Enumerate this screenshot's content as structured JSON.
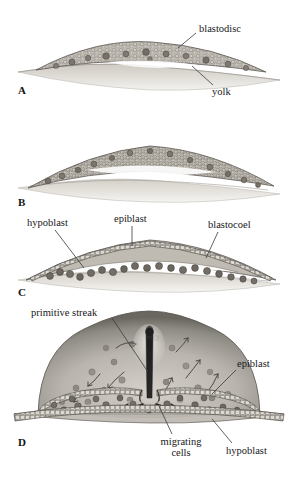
{
  "figure": {
    "background_color": "#ffffff",
    "panels": [
      {
        "letter": "A",
        "stage": "blastodisc on yolk",
        "labels": [
          "blastodisc",
          "yolk"
        ]
      },
      {
        "letter": "B",
        "stage": "cell layer separation",
        "labels": []
      },
      {
        "letter": "C",
        "stage": "epiblast and hypoblast with blastocoel",
        "labels": [
          "hypoblast",
          "epiblast",
          "blastocoel"
        ]
      },
      {
        "letter": "D",
        "stage": "primitive streak gastrulation",
        "labels": [
          "primitive streak",
          "epiblast",
          "migrating cells",
          "hypoblast"
        ]
      }
    ]
  },
  "panel_letters": {
    "a": "A",
    "b": "B",
    "c": "C",
    "d": "D"
  },
  "labels": {
    "blastodisc": "blastodisc",
    "yolk": "yolk",
    "hypoblast_c": "hypoblast",
    "epiblast_c": "epiblast",
    "blastocoel": "blastocoel",
    "primitive_streak": "primitive streak",
    "epiblast_d": "epiblast",
    "migrating_cells": "migrating cells",
    "hypoblast_d": "hypoblast"
  },
  "colors": {
    "ink": "#18181a",
    "leader_line": "#3a3a3c",
    "cell_fill": "#b9b5ad",
    "cell_stroke": "#55514b",
    "dark_cell": "#6d6862",
    "yolk_light": "#e2dfd9",
    "yolk_mid": "#c9c5bd",
    "dome_rim": "#6f6b66",
    "dome_interior": "#c3bfb8",
    "streak_dark": "#232323",
    "background": "#ffffff"
  }
}
